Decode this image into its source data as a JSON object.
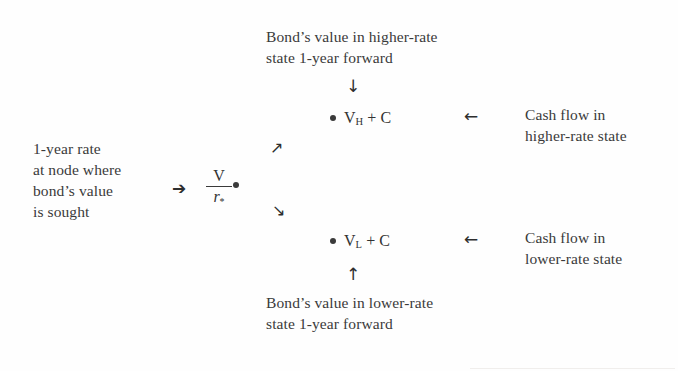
{
  "diagram": {
    "captions": {
      "top": {
        "line1": "Bond’s value in higher-rate",
        "line2": "state 1-year forward"
      },
      "bottom": {
        "line1": "Bond’s value in lower-rate",
        "line2": "state 1-year forward"
      },
      "left": {
        "line1": "1-year rate",
        "line2": "at node where",
        "line3": "bond’s value",
        "line4": "is sought"
      },
      "right_upper": {
        "line1": "Cash flow in",
        "line2": "higher-rate state"
      },
      "right_lower": {
        "line1": "Cash flow in",
        "line2": "lower-rate state"
      }
    },
    "nodes": {
      "center": {
        "numerator": "V",
        "denominator": "r",
        "denominator_subscript": "*"
      },
      "upper": {
        "value": "V",
        "subscript": "H",
        "suffix": "+ C"
      },
      "lower": {
        "value": "V",
        "subscript": "L",
        "suffix": "+ C"
      }
    },
    "arrows": {
      "down_to_upper_node": "↓",
      "up_to_lower_node": "↑",
      "left_to_center": "➔",
      "up_right_branch": "↗",
      "down_right_branch": "↘",
      "left_from_upper_label": "←",
      "left_from_lower_label": "←"
    },
    "colors": {
      "text": "#3a3a3a",
      "arrow": "#2e2e2e",
      "background": "#fefefe"
    }
  }
}
